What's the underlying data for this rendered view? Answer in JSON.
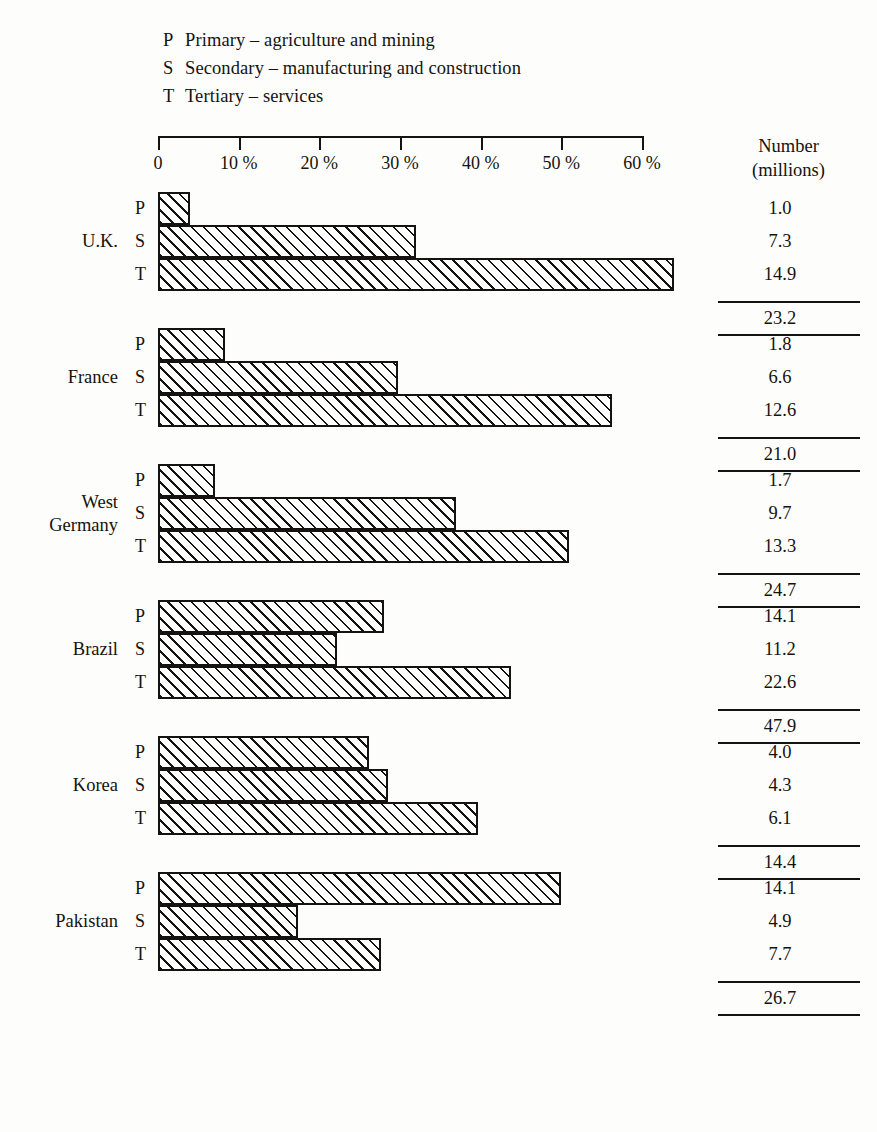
{
  "legend": [
    {
      "key": "P",
      "text": "Primary – agriculture and mining"
    },
    {
      "key": "S",
      "text": "Secondary – manufacturing and construction"
    },
    {
      "key": "T",
      "text": "Tertiary –  services"
    }
  ],
  "number_column": {
    "line1": "Number",
    "line2": "(millions)"
  },
  "chart_data": {
    "type": "bar",
    "title": "",
    "subtitle": "",
    "orientation": "horizontal",
    "xlabel": "",
    "ylabel": "",
    "xlim": [
      0,
      60
    ],
    "xtick_values": [
      0,
      10,
      20,
      30,
      40,
      50,
      60
    ],
    "xtick_labels": [
      "0",
      "10 %",
      "20 %",
      "30 %",
      "40 %",
      "50 %",
      "60 %"
    ],
    "grid": false,
    "legend_position": "top-left",
    "sector_keys": [
      "P",
      "S",
      "T"
    ],
    "sector_names": [
      "Primary",
      "Secondary",
      "Tertiary"
    ],
    "value_unit": "percent of workforce",
    "number_unit": "millions",
    "categories": [
      "U.K.",
      "France",
      "West Germany",
      "Brazil",
      "Korea",
      "Pakistan"
    ],
    "groups": [
      {
        "country": "U.K.",
        "country_lines": [
          "U.K."
        ],
        "rows": [
          {
            "key": "P",
            "percent": 4.0,
            "number": "1.0"
          },
          {
            "key": "S",
            "percent": 32.0,
            "number": "7.3"
          },
          {
            "key": "T",
            "percent": 64.0,
            "number": "14.9"
          }
        ],
        "total": "23.2"
      },
      {
        "country": "France",
        "country_lines": [
          "France"
        ],
        "rows": [
          {
            "key": "P",
            "percent": 8.3,
            "number": "1.8"
          },
          {
            "key": "S",
            "percent": 29.8,
            "number": "6.6"
          },
          {
            "key": "T",
            "percent": 56.3,
            "number": "12.6"
          }
        ],
        "total": "21.0"
      },
      {
        "country": "West Germany",
        "country_lines": [
          "West",
          "Germany"
        ],
        "rows": [
          {
            "key": "P",
            "percent": 7.1,
            "number": "1.7"
          },
          {
            "key": "S",
            "percent": 37.0,
            "number": "9.7"
          },
          {
            "key": "T",
            "percent": 51.0,
            "number": "13.3"
          }
        ],
        "total": "24.7"
      },
      {
        "country": "Brazil",
        "country_lines": [
          "Brazil"
        ],
        "rows": [
          {
            "key": "P",
            "percent": 28.0,
            "number": "14.1"
          },
          {
            "key": "S",
            "percent": 22.2,
            "number": "11.2"
          },
          {
            "key": "T",
            "percent": 43.8,
            "number": "22.6"
          }
        ],
        "total": "47.9"
      },
      {
        "country": "Korea",
        "country_lines": [
          "Korea"
        ],
        "rows": [
          {
            "key": "P",
            "percent": 26.2,
            "number": "4.0"
          },
          {
            "key": "S",
            "percent": 28.5,
            "number": "4.3"
          },
          {
            "key": "T",
            "percent": 39.7,
            "number": "6.1"
          }
        ],
        "total": "14.4"
      },
      {
        "country": "Pakistan",
        "country_lines": [
          "Pakistan"
        ],
        "rows": [
          {
            "key": "P",
            "percent": 50.0,
            "number": "14.1"
          },
          {
            "key": "S",
            "percent": 17.4,
            "number": "4.9"
          },
          {
            "key": "T",
            "percent": 27.6,
            "number": "7.7"
          }
        ],
        "total": "26.7"
      }
    ]
  },
  "colors": {
    "ink": "#15130f",
    "paper": "#fdfdfb",
    "hatch": "#15130f"
  }
}
